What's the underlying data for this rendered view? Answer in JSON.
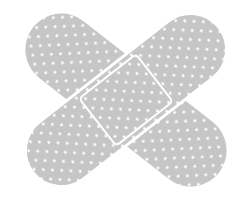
{
  "image": {
    "subject": "crossed-adhesive-bandages",
    "colors": {
      "bandage": "#c6c6c6",
      "holes": "#ffffff",
      "background": "#ffffff"
    }
  }
}
